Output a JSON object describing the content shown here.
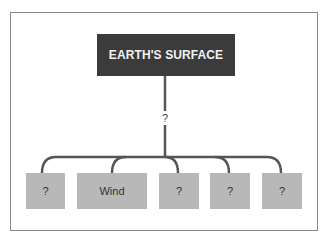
{
  "diagram": {
    "type": "tree",
    "root": {
      "label": "EARTH'S SURFACE",
      "fill": "#3b3b3b",
      "text_color": "#f2f2f2"
    },
    "connector_label": "?",
    "connector_color": "#555555",
    "children": [
      {
        "label": "?"
      },
      {
        "label": "Wind"
      },
      {
        "label": "?"
      },
      {
        "label": "?"
      },
      {
        "label": "?"
      }
    ],
    "child_fill": "#b8b8b8",
    "frame_color": "#8a8a8a"
  }
}
